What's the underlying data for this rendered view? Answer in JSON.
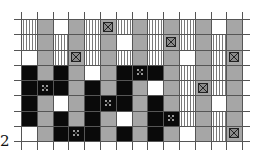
{
  "figure": {
    "row_label": "2",
    "columns": 14,
    "rows": 8,
    "legend_codes": {
      "S": "vertical-hatched",
      "G": "gray",
      "W": "white",
      "B": "black",
      "GX": "gray-with-crossed-box",
      "BX": "black-with-dotted-marker"
    },
    "colors": {
      "gray": "#a6a6a6",
      "black": "#0a0a0a",
      "white": "#ffffff",
      "grid": "#555555"
    },
    "grid": [
      [
        "S",
        "G",
        "W",
        "G",
        "S",
        "GX",
        "S",
        "G",
        "S",
        "G",
        "S",
        "G",
        "W",
        "G"
      ],
      [
        "S",
        "G",
        "S",
        "G",
        "S",
        "G",
        "W",
        "G",
        "S",
        "GX",
        "S",
        "G",
        "S",
        "G"
      ],
      [
        "W",
        "G",
        "S",
        "GX",
        "S",
        "G",
        "S",
        "G",
        "S",
        "G",
        "W",
        "G",
        "S",
        "GX"
      ],
      [
        "B",
        "G",
        "B",
        "G",
        "W",
        "G",
        "B",
        "BX",
        "B",
        "G",
        "S",
        "G",
        "S",
        "G"
      ],
      [
        "B",
        "BX",
        "B",
        "G",
        "B",
        "G",
        "B",
        "G",
        "W",
        "G",
        "S",
        "GX",
        "S",
        "G"
      ],
      [
        "B",
        "G",
        "W",
        "G",
        "B",
        "BX",
        "B",
        "G",
        "B",
        "G",
        "S",
        "G",
        "W",
        "G"
      ],
      [
        "B",
        "G",
        "B",
        "G",
        "B",
        "G",
        "W",
        "G",
        "B",
        "BX",
        "S",
        "G",
        "S",
        "G"
      ],
      [
        "W",
        "G",
        "B",
        "BX",
        "B",
        "G",
        "B",
        "G",
        "B",
        "G",
        "W",
        "G",
        "S",
        "GX"
      ]
    ]
  }
}
